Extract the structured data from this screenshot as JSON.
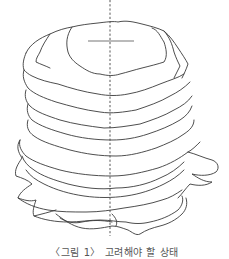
{
  "figure": {
    "stroke_color": "#3a3a3a",
    "background": "#ffffff",
    "layer_count": 14,
    "has_center_axis": true,
    "has_top_marker": true
  },
  "caption": {
    "text": "〈그림 1〉 고려해야 할 상태",
    "clipped": true
  }
}
